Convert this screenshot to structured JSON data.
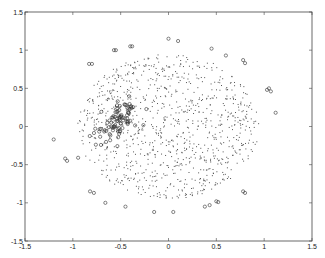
{
  "chart_data": {
    "type": "scatter",
    "title": "",
    "xlabel": "",
    "ylabel": "",
    "xlim": [
      -1.5,
      1.5
    ],
    "ylim": [
      -1.5,
      1.5
    ],
    "grid": false,
    "legend": null,
    "xticks": [
      "-1.5",
      "-1",
      "-0.5",
      "0",
      "0.5",
      "1",
      "1.5"
    ],
    "yticks": [
      "1.5",
      "1",
      "0.5",
      "0",
      "-0.5",
      "-1",
      "-1.5"
    ],
    "series": [
      {
        "name": "points",
        "marker": "dot",
        "color": "#555555",
        "description": "dense cloud of ~1000 small dots roughly uniform within a disk of radius ~0.95 centered at (0,0)",
        "cloud": {
          "cx": 0.0,
          "cy": 0.0,
          "rx": 0.95,
          "ry": 0.95,
          "count": 1000
        }
      },
      {
        "name": "cluster",
        "marker": "circle",
        "color": "#333333",
        "description": "dense elongated cluster of circle markers around (-0.55, 0.05), oriented top-left to bottom-right",
        "cloud": {
          "cx": -0.55,
          "cy": 0.07,
          "rx": 0.12,
          "ry": 0.22,
          "angle": -35,
          "count": 90
        }
      },
      {
        "name": "outliers",
        "marker": "circle",
        "color": "#333333",
        "points": [
          [
            -0.4,
            1.05
          ],
          [
            -0.38,
            1.05
          ],
          [
            -0.57,
            1.0
          ],
          [
            -0.55,
            1.0
          ],
          [
            -0.83,
            0.82
          ],
          [
            -0.8,
            0.82
          ],
          [
            0.0,
            1.15
          ],
          [
            0.1,
            1.12
          ],
          [
            0.45,
            1.02
          ],
          [
            0.6,
            0.93
          ],
          [
            0.78,
            0.87
          ],
          [
            0.8,
            0.83
          ],
          [
            1.03,
            0.48
          ],
          [
            1.05,
            0.5
          ],
          [
            1.07,
            0.46
          ],
          [
            1.12,
            0.18
          ],
          [
            -1.2,
            -0.17
          ],
          [
            -1.08,
            -0.42
          ],
          [
            -1.06,
            -0.45
          ],
          [
            -0.82,
            -0.85
          ],
          [
            -0.78,
            -0.87
          ],
          [
            -0.66,
            -1.0
          ],
          [
            -0.45,
            -1.05
          ],
          [
            -0.15,
            -1.12
          ],
          [
            0.05,
            -1.12
          ],
          [
            0.38,
            -1.05
          ],
          [
            0.43,
            -1.03
          ],
          [
            0.5,
            -0.98
          ],
          [
            0.52,
            -0.99
          ],
          [
            0.78,
            -0.85
          ],
          [
            0.8,
            -0.87
          ]
        ]
      }
    ]
  }
}
